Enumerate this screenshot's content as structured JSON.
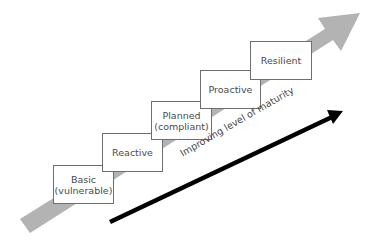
{
  "diagram": {
    "steps": [
      {
        "line1": "Basic",
        "line2": "(vulnerable)"
      },
      {
        "line1": "Reactive",
        "line2": ""
      },
      {
        "line1": "Planned",
        "line2": "(compliant)"
      },
      {
        "line1": "Proactive",
        "line2": ""
      },
      {
        "line1": "Resilient",
        "line2": ""
      }
    ],
    "axis_label": "Improving level of maturity",
    "colors": {
      "background_arrow": "#b3b3b3",
      "maturity_arrow": "#000000",
      "box_border": "#6e6e6e",
      "text": "#4a4a4a"
    }
  }
}
